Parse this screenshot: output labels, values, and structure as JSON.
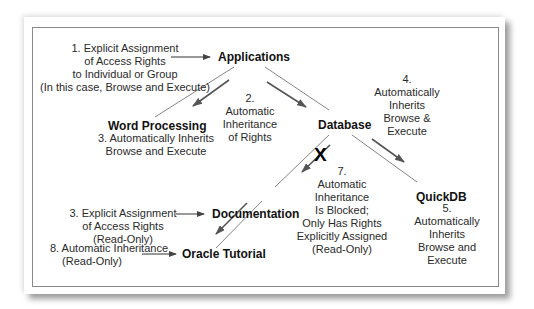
{
  "nodes": {
    "applications": "Applications",
    "word_processing": "Word Processing",
    "database": "Database",
    "documentation": "Documentation",
    "quickdb": "QuickDB",
    "oracle_tutorial": "Oracle Tutorial"
  },
  "annotations": {
    "a1": [
      "1. Explicit Assignment",
      "of Access Rights",
      "to Individual or Group",
      "(In this case, Browse and Execute)"
    ],
    "a2": [
      "2.",
      "Automatic",
      "Inheritance",
      "of Rights"
    ],
    "a3_word": [
      "3. Automatically Inherits",
      "Browse and Execute"
    ],
    "a3_doc": [
      "3. Explicit Assignment",
      "of Access Rights",
      "(Read-Only)"
    ],
    "a4": [
      "4.",
      "Automatically",
      "Inherits",
      "Browse &",
      "Execute"
    ],
    "a5": [
      "5.",
      "Automatically",
      "Inherits",
      "Browse and",
      "Execute"
    ],
    "a7": [
      "7.",
      "Automatic",
      "Inheritance",
      "Is Blocked;",
      "Only Has Rights",
      "Explicitly Assigned",
      "(Read-Only)"
    ],
    "a8": [
      "8. Automatic Inheritance",
      "(Read-Only)"
    ]
  },
  "blocked_mark": "X",
  "colors": {
    "line": "#555555",
    "arrow": "#444444",
    "border": "#8a8a8a"
  }
}
